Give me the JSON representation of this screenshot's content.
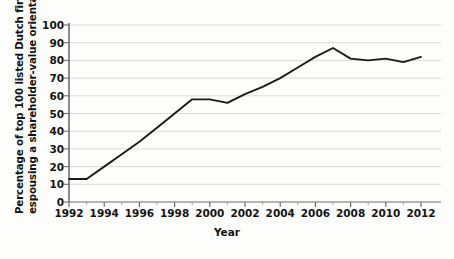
{
  "chart_data": {
    "type": "line",
    "title": "",
    "xlabel": "Year",
    "ylabel": "Percentage of top 100 listed Dutch firms espousing a shareholder-value orientation",
    "ylabel_line1": "Percentage of top 100 listed Dutch firms",
    "ylabel_line2": "espousing a shareholder-value orientation",
    "x": [
      1992,
      1993,
      1994,
      1995,
      1996,
      1997,
      1998,
      1999,
      2000,
      2001,
      2002,
      2003,
      2004,
      2005,
      2006,
      2007,
      2008,
      2009,
      2010,
      2011,
      2012
    ],
    "values": [
      13,
      13,
      20,
      27,
      34,
      42,
      50,
      58,
      58,
      56,
      61,
      65,
      70,
      76,
      82,
      87,
      81,
      80,
      81,
      79,
      82
    ],
    "series": [
      {
        "name": "Shareholder-value orientation",
        "values": [
          13,
          13,
          20,
          27,
          34,
          42,
          50,
          58,
          58,
          56,
          61,
          65,
          70,
          76,
          82,
          87,
          81,
          80,
          81,
          79,
          82
        ]
      }
    ],
    "y_ticks": [
      0,
      10,
      20,
      30,
      40,
      50,
      60,
      70,
      80,
      90,
      100
    ],
    "y_tick_labels": [
      "0",
      "10",
      "20",
      "30",
      "40",
      "50",
      "60",
      "70",
      "80",
      "90",
      "100"
    ],
    "x_ticks": [
      1992,
      1994,
      1996,
      1998,
      2000,
      2002,
      2004,
      2006,
      2008,
      2010,
      2012
    ],
    "x_tick_labels": [
      "1992",
      "1994",
      "1996",
      "1998",
      "2000",
      "2002",
      "2004",
      "2006",
      "2008",
      "2010",
      "2012"
    ],
    "x_minor_interval": 1,
    "xlim": [
      1992,
      2012
    ],
    "ylim": [
      0,
      100
    ],
    "grid": "horizontal",
    "grid_color": "#d6d6d6",
    "line_color": "#1a1a1a",
    "line_width": 1.9,
    "legend": "none",
    "legend_position": "none",
    "background": "#ffffff"
  }
}
